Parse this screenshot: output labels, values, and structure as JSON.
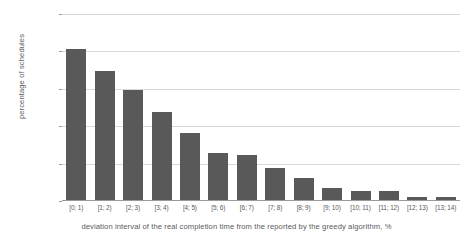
{
  "chart_data": {
    "type": "bar",
    "title": "",
    "xlabel": "deviation interval of the real completion time from the reported by the greedy algorithm, %",
    "ylabel": "percentage of schedules",
    "categories": [
      "[0; 1)",
      "[1; 2)",
      "[2; 3)",
      "[3; 4)",
      "[4; 5)",
      "[5; 6)",
      "[6; 7)",
      "[7; 8)",
      "[8; 9)",
      "[9; 10)",
      "[10; 11)",
      "[11; 12)",
      "[12; 13)",
      "[13; 14)"
    ],
    "values": [
      20.3,
      17.4,
      14.9,
      11.9,
      9.1,
      6.4,
      6.1,
      4.4,
      3.1,
      1.7,
      1.3,
      1.3,
      0.5,
      0.5
    ],
    "ylim": [
      0,
      25
    ],
    "yticks": [
      0,
      5,
      10,
      15,
      20,
      25
    ],
    "ytick_labels": [
      "0%",
      "5%",
      "10%",
      "15%",
      "20%",
      "25%"
    ],
    "grid": true,
    "legend": "none",
    "bar_color": "#595959",
    "grid_color": "#d9d9d9",
    "axis_color": "#9a9a9a",
    "text_color": "#5a5a5a"
  }
}
